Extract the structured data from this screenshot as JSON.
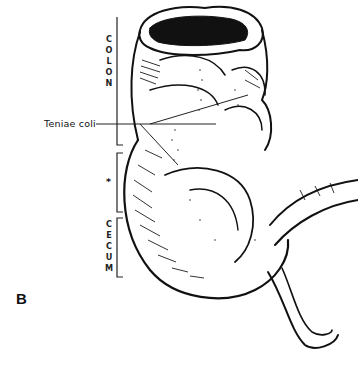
{
  "figure": {
    "panel_label": "B",
    "labels": {
      "colon": [
        "C",
        "O",
        "L",
        "O",
        "N"
      ],
      "asterisk": "*",
      "cecum": [
        "C",
        "E",
        "C",
        "U",
        "M"
      ],
      "teniae_coli": "Teniae coli"
    },
    "colors": {
      "ink": "#111111",
      "background": "#ffffff"
    }
  }
}
